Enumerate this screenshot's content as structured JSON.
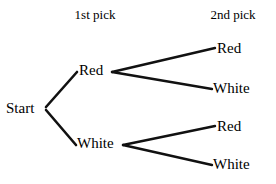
{
  "diagram": {
    "type": "tree-diagram",
    "stroke_color": "#111111",
    "text_color": "#000000",
    "background_color": "#ffffff",
    "headers": {
      "first": "1st pick",
      "second": "2nd pick"
    },
    "nodes": {
      "root": "Start",
      "level1": {
        "red": "Red",
        "white": "White"
      },
      "level2": {
        "red_red": "Red",
        "red_white": "White",
        "white_red": "Red",
        "white_white": "White"
      }
    },
    "edges": [
      {
        "name": "start-to-red",
        "x1": 46,
        "y1": 107,
        "x2": 77,
        "y2": 72
      },
      {
        "name": "start-to-white",
        "x1": 46,
        "y1": 110,
        "x2": 76,
        "y2": 145
      },
      {
        "name": "red-to-red",
        "x1": 112,
        "y1": 72,
        "x2": 215,
        "y2": 48
      },
      {
        "name": "red-to-white",
        "x1": 112,
        "y1": 72,
        "x2": 212,
        "y2": 89
      },
      {
        "name": "white-to-red",
        "x1": 123,
        "y1": 145,
        "x2": 215,
        "y2": 126
      },
      {
        "name": "white-to-white",
        "x1": 123,
        "y1": 145,
        "x2": 212,
        "y2": 165
      }
    ]
  }
}
